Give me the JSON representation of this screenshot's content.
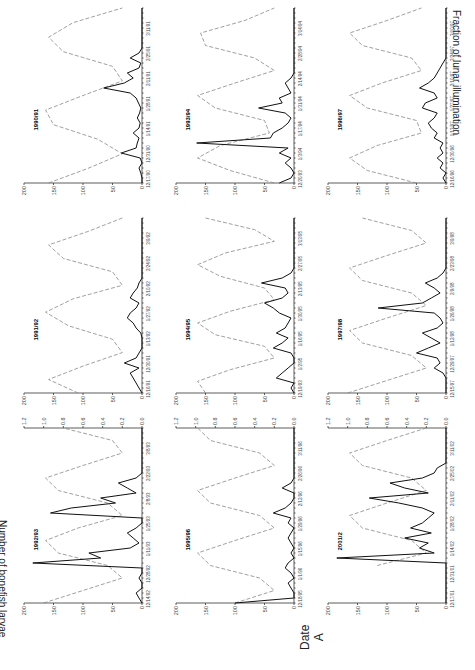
{
  "figure": {
    "y_label_left": "Number of bonefish larvae",
    "y_label_right": "Fraction of lunar illumination",
    "x_label": "Date",
    "panel_letter": "A"
  },
  "chart_data": {
    "type": "line",
    "layout": "3x3 small multiples, figure rotated 90 degrees",
    "title": "",
    "xlabel": "Date",
    "ylabel": "Number of bonefish larvae",
    "ylabel_right": "Fraction of lunar illumination",
    "ylim": [
      0,
      200
    ],
    "ylim_right": [
      0,
      1.2
    ],
    "y_ticks": [
      0,
      50,
      100,
      150,
      200
    ],
    "y_ticks_right": [
      0.0,
      0.2,
      0.4,
      0.6,
      0.8,
      1.0,
      1.2
    ],
    "legend": [
      {
        "name": "Bonefish larvae",
        "style": "solid black"
      },
      {
        "name": "Lunar illumination",
        "style": "dashed gray"
      }
    ],
    "panels": [
      {
        "season": "1990/91",
        "x_ticks": [
          "12/17/90",
          "12/31/90",
          "1/14/91",
          "1/28/91",
          "2/11/91",
          "2/25/91",
          "3/11/91"
        ],
        "larvae": [
          0,
          0,
          2,
          5,
          0,
          3,
          35,
          10,
          8,
          5,
          15,
          5,
          3,
          8,
          4,
          2,
          6,
          10,
          20,
          65,
          30,
          15,
          25,
          5,
          2,
          20,
          5,
          0,
          0,
          0,
          0,
          0,
          0,
          0,
          0,
          0
        ],
        "lunar": [
          0.95,
          0.55,
          0.2,
          0.45,
          0.9,
          0.98,
          0.6,
          0.2,
          0.3,
          0.8,
          0.95,
          0.7,
          0.2
        ]
      },
      {
        "season": "1991/92",
        "x_ticks": [
          "12/16/91",
          "12/30/91",
          "1/13/92",
          "1/27/92",
          "2/10/92",
          "2/24/92",
          "3/9/92"
        ],
        "larvae": [
          0,
          5,
          10,
          15,
          20,
          5,
          30,
          10,
          5,
          0,
          0,
          0,
          2,
          10,
          15,
          25,
          20,
          10,
          5,
          20,
          15,
          8,
          5,
          0,
          0,
          0,
          0,
          0,
          0,
          0,
          0,
          0,
          0,
          0,
          0,
          0
        ],
        "lunar": [
          0.65,
          0.95,
          0.6,
          0.2,
          0.3,
          0.75,
          0.98,
          0.7,
          0.2,
          0.3,
          0.8,
          0.95,
          0.55,
          0.2
        ]
      },
      {
        "season": "1992/93",
        "x_ticks": [
          "12/14/92",
          "12/28/92",
          "1/11/93",
          "1/25/93",
          "2/8/93",
          "2/22/93",
          "3/8/93"
        ],
        "larvae": [
          0,
          5,
          10,
          0,
          0,
          5,
          0,
          0,
          185,
          70,
          90,
          20,
          5,
          15,
          25,
          10,
          0,
          0,
          155,
          120,
          45,
          70,
          10,
          25,
          40,
          10,
          0,
          0,
          0,
          0,
          0,
          0,
          0,
          0,
          0,
          0
        ],
        "lunar": [
          1.0,
          0.6,
          0.2,
          0.35,
          0.85,
          0.98,
          0.65,
          0.2,
          0.35,
          0.85,
          0.98,
          0.6,
          0.2,
          0.3,
          0.8
        ]
      },
      {
        "season": "1993/94",
        "x_ticks": [
          "12/20/93",
          "1/3/94",
          "1/17/94",
          "1/31/94",
          "2/14/94",
          "2/28/94",
          "3/14/94"
        ],
        "larvae": [
          25,
          5,
          0,
          5,
          15,
          5,
          25,
          10,
          165,
          40,
          35,
          20,
          10,
          5,
          15,
          60,
          20,
          25,
          5,
          10,
          15,
          5,
          0,
          0,
          0,
          0,
          0,
          0,
          0,
          0,
          0,
          0,
          0,
          0,
          0,
          0
        ],
        "lunar": [
          0.2,
          0.65,
          0.98,
          0.75,
          0.25,
          0.3,
          0.8,
          0.98,
          0.6,
          0.2,
          0.4,
          0.9,
          0.95,
          0.5,
          0.2
        ]
      },
      {
        "season": "1994/95",
        "x_ticks": [
          "12/19/93",
          "1/2/95",
          "1/16/95",
          "1/30/95",
          "2/13/95",
          "2/27/95",
          "3/13/95"
        ],
        "larvae": [
          0,
          5,
          0,
          30,
          20,
          10,
          0,
          0,
          5,
          35,
          20,
          10,
          30,
          15,
          10,
          5,
          25,
          35,
          50,
          20,
          10,
          15,
          55,
          20,
          5,
          0,
          0,
          0,
          0,
          0,
          0,
          0,
          0,
          0,
          0,
          0
        ],
        "lunar": [
          0.9,
          0.98,
          0.65,
          0.2,
          0.3,
          0.8,
          0.98,
          0.65,
          0.2,
          0.3,
          0.75,
          0.98,
          0.7,
          0.2,
          0.4,
          0.9
        ]
      },
      {
        "season": "1995/96",
        "x_ticks": [
          "12/18/95",
          "1/1/96",
          "1/15/96",
          "1/29/96",
          "2/12/96",
          "2/26/96",
          "3/11/96"
        ],
        "larvae": [
          100,
          0,
          0,
          5,
          10,
          0,
          5,
          15,
          10,
          0,
          5,
          0,
          5,
          10,
          5,
          0,
          10,
          5,
          35,
          15,
          5,
          0,
          0,
          20,
          5,
          0,
          0,
          0,
          0,
          0,
          0,
          0,
          0,
          0,
          0,
          0
        ],
        "lunar": [
          0.6,
          0.2,
          0.35,
          0.85,
          0.98,
          0.6,
          0.2,
          0.35,
          0.85,
          0.98,
          0.6,
          0.2,
          0.35,
          0.85,
          0.98
        ]
      },
      {
        "season": "1996/97",
        "x_ticks": [
          "12/16/96",
          "12/30/96",
          "1/13/97",
          "1/27/97",
          "2/10/97",
          "2/24/97",
          "3/10/97"
        ],
        "larvae": [
          0,
          5,
          0,
          10,
          5,
          15,
          5,
          10,
          5,
          20,
          15,
          25,
          30,
          20,
          15,
          40,
          35,
          15,
          20,
          45,
          30,
          20,
          15,
          10,
          5,
          0,
          0,
          0,
          0,
          0,
          0,
          0,
          0,
          0,
          0,
          0
        ],
        "lunar": [
          0.3,
          0.8,
          0.98,
          0.7,
          0.25,
          0.3,
          0.8,
          0.98,
          0.65,
          0.25,
          0.35,
          0.85,
          0.98,
          0.6,
          0.25
        ]
      },
      {
        "season": "1997/98",
        "x_ticks": [
          "12/15/97",
          "12/29/97",
          "1/12/98",
          "1/26/98",
          "2/9/98",
          "2/23/98",
          "3/9/98"
        ],
        "larvae": [
          0,
          0,
          0,
          0,
          5,
          20,
          10,
          15,
          50,
          30,
          10,
          25,
          40,
          15,
          5,
          10,
          20,
          115,
          40,
          25,
          10,
          20,
          35,
          15,
          5,
          0,
          0,
          0,
          0,
          0,
          0,
          0,
          0,
          0,
          0,
          0
        ],
        "lunar": [
          1.0,
          0.6,
          0.2,
          0.35,
          0.85,
          0.98,
          0.6,
          0.2,
          0.35,
          0.85,
          0.98,
          0.6,
          0.2,
          0.35,
          0.85
        ]
      },
      {
        "season": "2001/2",
        "x_ticks": [
          "12/17/01",
          "12/31/01",
          "1/14/02",
          "1/28/02",
          "2/11/02",
          "2/25/02",
          "3/11/02"
        ],
        "larvae": [
          0,
          0,
          0,
          0,
          0,
          0,
          0,
          0,
          0,
          185,
          20,
          45,
          30,
          70,
          25,
          60,
          40,
          30,
          20,
          40,
          80,
          130,
          30,
          70,
          95,
          40,
          20,
          15,
          0,
          0,
          0,
          0,
          0,
          0,
          0,
          0
        ],
        "lunar": [
          null,
          null,
          null,
          0.7,
          0.2,
          0.35,
          0.85,
          0.98,
          0.6,
          0.2,
          0.35,
          0.85,
          0.98,
          0.6,
          0.2
        ]
      }
    ]
  }
}
